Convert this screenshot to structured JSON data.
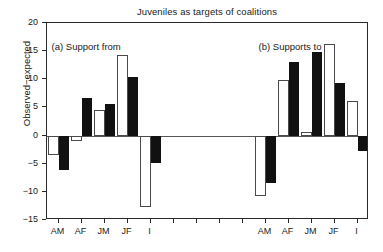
{
  "chart_data": {
    "type": "bar",
    "title": "Juveniles as targets of coalitions",
    "xlabel": "",
    "ylabel": "Observed−expected",
    "ylim": [
      -15,
      20
    ],
    "ytick_values": [
      20,
      15,
      10,
      5,
      0,
      -5,
      -10,
      -15
    ],
    "ytick_labels": [
      "20",
      "15",
      "10",
      "5",
      "0",
      "−5",
      "−10",
      "−15"
    ],
    "grid": false,
    "legend": "none",
    "zero_line": true,
    "panels": [
      {
        "key": "a",
        "annotation": "(a) Support from",
        "categories": [
          "AM",
          "AF",
          "JM",
          "JF",
          "I"
        ],
        "series": [
          {
            "name": "open",
            "fill": "white",
            "values": [
              -3.5,
              -0.9,
              4.6,
              14.3,
              -12.7
            ]
          },
          {
            "name": "filled",
            "fill": "black",
            "values": [
              -6.2,
              6.6,
              5.6,
              10.4,
              -4.9
            ]
          }
        ]
      },
      {
        "key": "b",
        "annotation": "(b) Supports to",
        "categories": [
          "AM",
          "AF",
          "JM",
          "JF",
          "I"
        ],
        "series": [
          {
            "name": "open",
            "fill": "white",
            "values": [
              -10.8,
              9.8,
              0.7,
              16.2,
              6.2
            ]
          },
          {
            "name": "filled",
            "fill": "black",
            "values": [
              -8.4,
              13.0,
              14.9,
              9.3,
              -2.8
            ]
          }
        ]
      }
    ],
    "colors": {
      "open_bar_fill": "#ffffff",
      "open_bar_edge": "#4a4a4a",
      "filled_bar_fill": "#111111",
      "axis": "#2a2a2a",
      "background": "#ffffff"
    }
  },
  "axis": {
    "unlabeled_tick_count_between_panels": 4
  }
}
